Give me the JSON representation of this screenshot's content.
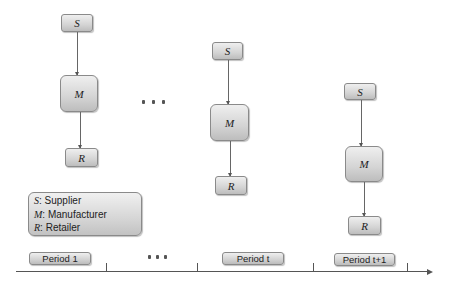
{
  "diagram": {
    "periods": [
      {
        "id": "period-1",
        "supplier": "S",
        "manufacturer": "M",
        "retailer": "R"
      },
      {
        "id": "period-t",
        "supplier": "S",
        "manufacturer": "M",
        "retailer": "R"
      },
      {
        "id": "period-t1",
        "supplier": "S",
        "manufacturer": "M",
        "retailer": "R"
      }
    ],
    "ellipsis": "..."
  },
  "legend": {
    "items": [
      {
        "symbol": "S",
        "label": ": Supplier"
      },
      {
        "symbol": "M",
        "label": ": Manufacturer"
      },
      {
        "symbol": "R",
        "label": ": Retailer"
      }
    ]
  },
  "timeline": {
    "labels": [
      "Period 1",
      "Period t",
      "Period t+1"
    ],
    "ellipsis": "..."
  }
}
